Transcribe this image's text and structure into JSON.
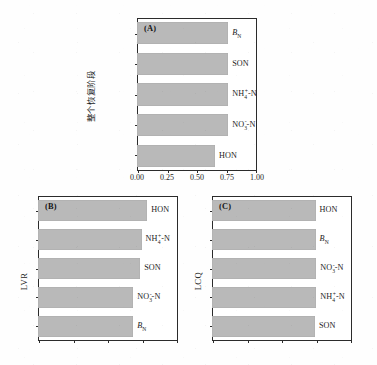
{
  "figure": {
    "panel_count": 3,
    "bar_color": "#b9b9b9",
    "frame_color": "#2b2b2b"
  },
  "chart_data": [
    {
      "type": "bar",
      "orientation": "horizontal",
      "panel": "(A)",
      "title": "",
      "xlabel": "",
      "ylabel": "整个恢复阶段",
      "xlim": [
        0.0,
        1.0
      ],
      "xticks": [
        0.0,
        0.25,
        0.5,
        0.75,
        1.0
      ],
      "xticklabels": [
        "0.00",
        "0.25",
        "0.50",
        "0.75",
        "1.00"
      ],
      "xticklabels_visible": true,
      "grid": false,
      "legend": null,
      "categories": [
        "B_N",
        "SON",
        "NH4+-N",
        "NO3--N",
        "HON"
      ],
      "category_labels": [
        "B<sub>N</sub>",
        "SON",
        "NH4+-N",
        "NO3--N",
        "HON"
      ],
      "values": [
        0.76,
        0.76,
        0.76,
        0.76,
        0.65
      ]
    },
    {
      "type": "bar",
      "orientation": "horizontal",
      "panel": "(B)",
      "title": "",
      "xlabel": "",
      "ylabel": "LVR",
      "xlim": [
        0.0,
        1.0
      ],
      "xticks": [
        0.0,
        0.25,
        0.5,
        0.75,
        1.0
      ],
      "xticklabels": [],
      "xticklabels_visible": false,
      "grid": false,
      "legend": null,
      "categories": [
        "HON",
        "NH4+-N",
        "SON",
        "NO3--N",
        "B_N"
      ],
      "category_labels": [
        "HON",
        "NH4+-N",
        "SON",
        "NO3--N",
        "B<sub>N</sub>"
      ],
      "values": [
        0.78,
        0.74,
        0.73,
        0.68,
        0.68
      ]
    },
    {
      "type": "bar",
      "orientation": "horizontal",
      "panel": "(C)",
      "title": "",
      "xlabel": "",
      "ylabel": "LCQ",
      "xlim": [
        0.0,
        1.0
      ],
      "xticks": [
        0.0,
        0.25,
        0.5,
        0.75,
        1.0
      ],
      "xticklabels": [],
      "xticklabels_visible": false,
      "grid": false,
      "legend": null,
      "categories": [
        "HON",
        "B_N",
        "NO3--N",
        "NH4+-N",
        "SON"
      ],
      "category_labels": [
        "HON",
        "B<sub>N</sub>",
        "NO3--N",
        "NH4+-N",
        "SON"
      ],
      "values": [
        0.74,
        0.74,
        0.745,
        0.745,
        0.735
      ]
    }
  ],
  "panels": {
    "a": {
      "tag": "(A)",
      "ylabel": "整个恢复阶段",
      "xticklabels": [
        "0.00",
        "0.25",
        "0.50",
        "0.75",
        "1.00"
      ],
      "bars": [
        {
          "label_plain": "BN",
          "value": 0.76
        },
        {
          "label_plain": "SON",
          "value": 0.76
        },
        {
          "label_plain": "NH4+-N",
          "value": 0.76
        },
        {
          "label_plain": "NO3--N",
          "value": 0.76
        },
        {
          "label_plain": "HON",
          "value": 0.65
        }
      ]
    },
    "b": {
      "tag": "(B)",
      "ylabel": "LVR",
      "bars": [
        {
          "label_plain": "HON",
          "value": 0.78
        },
        {
          "label_plain": "NH4+-N",
          "value": 0.74
        },
        {
          "label_plain": "SON",
          "value": 0.73
        },
        {
          "label_plain": "NO3--N",
          "value": 0.68
        },
        {
          "label_plain": "BN",
          "value": 0.68
        }
      ]
    },
    "c": {
      "tag": "(C)",
      "ylabel": "LCQ",
      "bars": [
        {
          "label_plain": "HON",
          "value": 0.74
        },
        {
          "label_plain": "BN",
          "value": 0.74
        },
        {
          "label_plain": "NO3--N",
          "value": 0.745
        },
        {
          "label_plain": "NH4+-N",
          "value": 0.745
        },
        {
          "label_plain": "SON",
          "value": 0.735
        }
      ]
    }
  },
  "labels": {
    "son": "SON",
    "hon": "HON",
    "bn_base": "B",
    "bn_sub": "N",
    "nh4_base": "NH",
    "nh4_sub": "4",
    "nh4_sup": "+",
    "nh4_tail": "-N",
    "no3_base": "NO",
    "no3_sub": "3",
    "no3_sup": "-",
    "no3_tail": "-N"
  }
}
